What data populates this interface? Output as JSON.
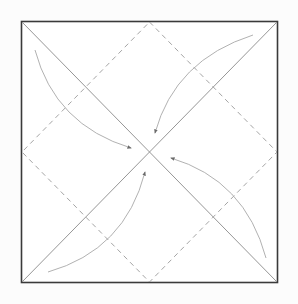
{
  "diagram": {
    "type": "origami-fold-diagram",
    "colors": {
      "background": "#fcfcfc",
      "square_fill": "#ffffff",
      "square_stroke": "#3a3a3a",
      "diagonal_stroke": "#8a8a8a",
      "dashed_stroke": "#9a9a9a",
      "arrow_stroke": "#a8a8a8",
      "arrowhead": "#6a6a6a"
    },
    "square": {
      "x": 21,
      "y": 21,
      "width": 256,
      "height": 261
    },
    "center": {
      "x": 149,
      "y": 152
    },
    "lines": {
      "solid_diagonals": 2,
      "dashed_diamond_edges": 4
    },
    "arrows": [
      {
        "name": "top-left-corner-fold",
        "from": [
          35,
          50
        ],
        "to": [
          131,
          148
        ]
      },
      {
        "name": "top-right-corner-fold",
        "from": [
          253,
          35
        ],
        "to": [
          155,
          133
        ]
      },
      {
        "name": "bottom-right-corner-fold",
        "from": [
          266,
          258
        ],
        "to": [
          171,
          158
        ]
      },
      {
        "name": "bottom-left-corner-fold",
        "from": [
          48,
          272
        ],
        "to": [
          145,
          172
        ]
      }
    ]
  }
}
